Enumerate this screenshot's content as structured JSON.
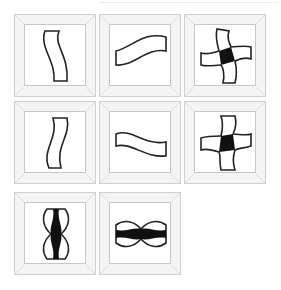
{
  "puzzle": {
    "description": "Grid of 8 beveled frames containing line figures (3x3 matrix with the last cell empty)",
    "cells": [
      {
        "row": 1,
        "col": 1,
        "figure": "vertical-wavy-strip"
      },
      {
        "row": 1,
        "col": 2,
        "figure": "horizontal-wavy-strip"
      },
      {
        "row": 1,
        "col": 3,
        "figure": "pinwheel-cross-filled-center"
      },
      {
        "row": 2,
        "col": 1,
        "figure": "vertical-wavy-strip-mirrored"
      },
      {
        "row": 2,
        "col": 2,
        "figure": "horizontal-wavy-strip-mirrored"
      },
      {
        "row": 2,
        "col": 3,
        "figure": "pinwheel-cross-filled-center-mirrored"
      },
      {
        "row": 3,
        "col": 1,
        "figure": "vertical-overlap-filled"
      },
      {
        "row": 3,
        "col": 2,
        "figure": "horizontal-overlap-filled"
      }
    ],
    "colors": {
      "stroke": "#222222",
      "fill": "#111111",
      "frame": "#f4f4f4",
      "frame_border": "#cfcfcf"
    }
  }
}
